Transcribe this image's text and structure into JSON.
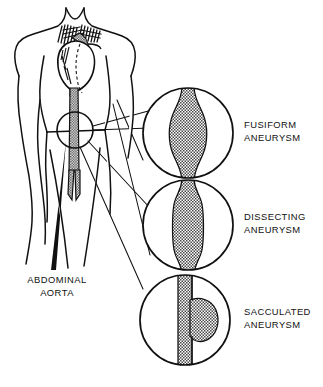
{
  "figure": {
    "title_visible": false,
    "background_color": "#ffffff",
    "ink_color": "#111111",
    "halftone_color": "#8a8a8a"
  },
  "body_diagram": {
    "name": "human torso anterior view",
    "parts": [
      "neck",
      "shoulders",
      "left-arm",
      "right-arm",
      "chest",
      "heart",
      "aortic-arch",
      "great-vessels",
      "descending-aorta",
      "abdominal-aorta",
      "iliac-bifurcation"
    ],
    "highlight_circle": {
      "name": "abdominal-aorta-highlight",
      "cx": 75,
      "cy": 130,
      "r": 18
    }
  },
  "labels": {
    "abdominal_aorta": {
      "line1": "ABDOMINAL",
      "line2": "AORTA",
      "x": 57,
      "y1": 283,
      "y2": 296
    }
  },
  "magnifiers": [
    {
      "id": "fusiform",
      "circle": {
        "cx": 188,
        "cy": 133,
        "r": 45
      },
      "vessel": {
        "type": "fusiform",
        "description": "symmetric spindle-shaped dilation of the aorta",
        "shading": "halftone"
      },
      "label": {
        "line1": "FUSIFORM",
        "line2": "ANEURYSM",
        "x": 244,
        "y1": 128,
        "y2": 141
      }
    },
    {
      "id": "dissecting",
      "circle": {
        "cx": 188,
        "cy": 225,
        "r": 45
      },
      "vessel": {
        "type": "dissecting",
        "description": "elongated tubular dilation with dissected wall layers",
        "shading": "halftone"
      },
      "label": {
        "line1": "DISSECTING",
        "line2": "ANEURYSM",
        "x": 244,
        "y1": 220,
        "y2": 233
      }
    },
    {
      "id": "sacculated",
      "circle": {
        "cx": 185,
        "cy": 320,
        "r": 45
      },
      "vessel": {
        "type": "sacculated",
        "description": "asymmetric saccular outpouching on one side of the aorta",
        "shading": "halftone"
      },
      "label": {
        "line1": "SACCULATED",
        "line2": "ANEURYSM",
        "x": 244,
        "y1": 315,
        "y2": 328
      }
    }
  ]
}
